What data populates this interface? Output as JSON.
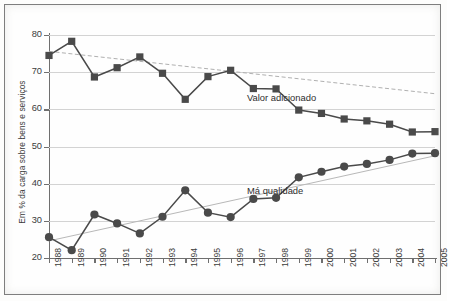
{
  "chart_data": {
    "type": "line",
    "title": "",
    "xlabel": "",
    "ylabel": "Em % da carga sobre bens e serviços",
    "ylim": [
      20,
      80
    ],
    "ytick_labels": [
      "20",
      "30",
      "40",
      "50",
      "60",
      "70",
      "80"
    ],
    "yticks": [
      20,
      30,
      40,
      50,
      60,
      70,
      80
    ],
    "grid": true,
    "legend_position": "inline-annotation",
    "categories": [
      "1988",
      "1989",
      "1990",
      "1991",
      "1992",
      "1993",
      "1994",
      "1995",
      "1996",
      "1997",
      "1998",
      "1999",
      "2000",
      "2001",
      "2002",
      "2003",
      "2004",
      "2005"
    ],
    "x": [
      1988,
      1989,
      1990,
      1991,
      1992,
      1993,
      1994,
      1995,
      1996,
      1997,
      1998,
      1999,
      2000,
      2001,
      2002,
      2003,
      2004,
      2005
    ],
    "series": [
      {
        "name": "Valor adicionado",
        "marker": "square",
        "color": "#4a4a4a",
        "values": [
          74.5,
          78.3,
          68.7,
          71.2,
          74.1,
          69.7,
          62.7,
          68.8,
          70.5,
          65.6,
          65.5,
          59.8,
          58.9,
          57.4,
          56.9,
          56.0,
          53.9,
          54.0
        ],
        "trendline": {
          "start": 75.6,
          "end": 64.2,
          "style": "dashed",
          "color": "#b0b0b0"
        }
      },
      {
        "name": "Má qualidade",
        "marker": "circle",
        "color": "#4a4a4a",
        "values": [
          25.6,
          22.1,
          31.7,
          29.3,
          26.6,
          31.1,
          38.2,
          32.2,
          31.0,
          35.9,
          36.2,
          41.7,
          43.2,
          44.6,
          45.3,
          46.4,
          48.1,
          48.2
        ],
        "trendline": {
          "start": 24.6,
          "end": 47.5,
          "style": "solid",
          "color": "#b8b8b8"
        }
      }
    ],
    "annotations": [
      {
        "text": "Valor adicionado",
        "series": "Valor adicionado"
      },
      {
        "text": "Má qualidade",
        "series": "Má qualidade"
      }
    ]
  }
}
